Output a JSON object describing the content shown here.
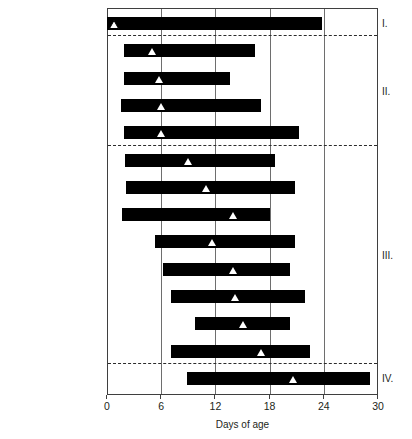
{
  "chart_data": {
    "type": "bar",
    "orientation": "horizontal",
    "title": "",
    "xlabel": "Days of age",
    "ylabel": "",
    "xlim": [
      0,
      30
    ],
    "xticks": [
      0,
      6,
      12,
      18,
      24,
      30
    ],
    "xtick_labels": [
      "0",
      "6",
      "12",
      "18",
      "24",
      "30"
    ],
    "grid": "vertical gridlines at 6, 12, 18, 24",
    "legend": "none",
    "marker_note": "white triangle marks median / peak day of task performance",
    "categories": [
      "Cleaning cells",
      "Feeding brood",
      "Capping brood",
      "Trimming cappings*",
      "Attending queen",
      "Grooming nestmates",
      "Feeding nestmates",
      "Ventilating",
      "Shaping comb",
      "Receiving nectar",
      "Packing pollen",
      "Storing nectar",
      "Guarding",
      "Foraging"
    ],
    "bars": [
      {
        "task": "Cleaning cells",
        "start": 0.0,
        "end": 23.8,
        "marker": 0.8,
        "marker_style": "hollow",
        "group": "I."
      },
      {
        "task": "Feeding brood",
        "start": 1.9,
        "end": 16.4,
        "marker": 5.0,
        "marker_style": "filled",
        "group": "II."
      },
      {
        "task": "Capping brood",
        "start": 1.9,
        "end": 13.6,
        "marker": 5.8,
        "marker_style": "filled",
        "group": "II."
      },
      {
        "task": "Trimming cappings*",
        "start": 1.5,
        "end": 17.0,
        "marker": 6.0,
        "marker_style": "filled",
        "group": "II."
      },
      {
        "task": "Attending queen",
        "start": 1.9,
        "end": 21.3,
        "marker": 6.0,
        "marker_style": "filled",
        "group": "II."
      },
      {
        "task": "Grooming nestmates",
        "start": 2.0,
        "end": 18.6,
        "marker": 9.0,
        "marker_style": "filled",
        "group": "III."
      },
      {
        "task": "Feeding nestmates",
        "start": 2.1,
        "end": 20.8,
        "marker": 11.0,
        "marker_style": "filled",
        "group": "III."
      },
      {
        "task": "Ventilating",
        "start": 1.7,
        "end": 18.0,
        "marker": 14.0,
        "marker_style": "filled",
        "group": "III."
      },
      {
        "task": "Shaping comb",
        "start": 5.3,
        "end": 20.8,
        "marker": 11.6,
        "marker_style": "filled",
        "group": "III."
      },
      {
        "task": "Receiving nectar",
        "start": 6.2,
        "end": 20.3,
        "marker": 14.0,
        "marker_style": "filled",
        "group": "III."
      },
      {
        "task": "Packing pollen",
        "start": 7.1,
        "end": 21.9,
        "marker": 14.2,
        "marker_style": "filled",
        "group": "III."
      },
      {
        "task": "Storing nectar",
        "start": 9.7,
        "end": 20.3,
        "marker": 15.0,
        "marker_style": "filled",
        "group": "III."
      },
      {
        "task": "Guarding",
        "start": 7.1,
        "end": 22.5,
        "marker": 17.0,
        "marker_style": "filled",
        "group": "III."
      },
      {
        "task": "Foraging",
        "start": 8.9,
        "end": 29.1,
        "marker": 20.6,
        "marker_style": "filled",
        "group": "IV."
      }
    ],
    "groups": [
      {
        "label": "I.",
        "tasks": [
          "Cleaning cells"
        ]
      },
      {
        "label": "II.",
        "tasks": [
          "Feeding brood",
          "Capping brood",
          "Trimming cappings*",
          "Attending queen"
        ]
      },
      {
        "label": "III.",
        "tasks": [
          "Grooming nestmates",
          "Feeding nestmates",
          "Ventilating",
          "Shaping comb",
          "Receiving nectar",
          "Packing pollen",
          "Storing nectar",
          "Guarding"
        ]
      },
      {
        "label": "IV.",
        "tasks": [
          "Foraging"
        ]
      }
    ]
  }
}
